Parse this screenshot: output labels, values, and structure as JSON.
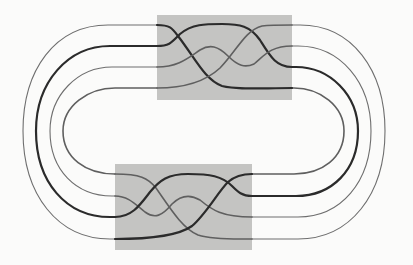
{
  "figure": {
    "description": "Closure of a 4-strand braid: two shaded braid boxes connected by nested closing arcs",
    "strand_count": 4,
    "colors": {
      "background": "#fbfbfa",
      "box_fill": "#c4c4c2",
      "strand_dark": "#2b2b2b",
      "strand_medium": "#5f5f5f",
      "strand_light": "#6e6e6e"
    },
    "boxes": [
      {
        "name": "top-braid-box",
        "x": 157,
        "y": 15,
        "width": 135,
        "height": 85
      },
      {
        "name": "bottom-braid-box",
        "x": 115,
        "y": 164,
        "width": 137,
        "height": 86
      }
    ],
    "strand_levels": {
      "top": [
        25,
        46,
        67,
        88
      ],
      "bottom": [
        174,
        196,
        217,
        239
      ]
    }
  }
}
